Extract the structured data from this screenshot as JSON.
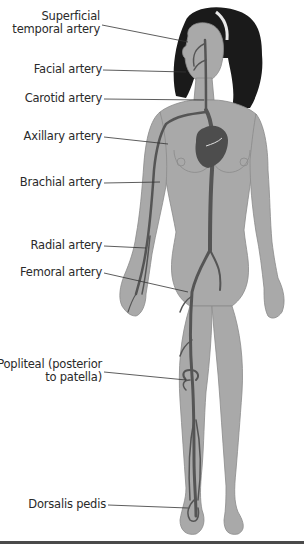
{
  "figure": {
    "colors": {
      "background": "#ffffff",
      "skin": "#a9a9a9",
      "skin_shadow": "#8f8f8f",
      "artery": "#555555",
      "hair": "#1a1a1a",
      "label_text": "#2a2a2a",
      "leader_line": "#333333"
    },
    "labels": [
      {
        "id": "superficial-temporal",
        "lines": [
          "Superficial",
          "temporal artery"
        ]
      },
      {
        "id": "facial",
        "lines": [
          "Facial artery"
        ]
      },
      {
        "id": "carotid",
        "lines": [
          "Carotid artery"
        ]
      },
      {
        "id": "axillary",
        "lines": [
          "Axillary artery"
        ]
      },
      {
        "id": "brachial",
        "lines": [
          "Brachial artery"
        ]
      },
      {
        "id": "radial",
        "lines": [
          "Radial artery"
        ]
      },
      {
        "id": "femoral",
        "lines": [
          "Femoral artery"
        ]
      },
      {
        "id": "popliteal",
        "lines": [
          "Popliteal (posterior",
          "to patella)"
        ]
      },
      {
        "id": "dorsalis-pedis",
        "lines": [
          "Dorsalis pedis"
        ]
      }
    ]
  }
}
